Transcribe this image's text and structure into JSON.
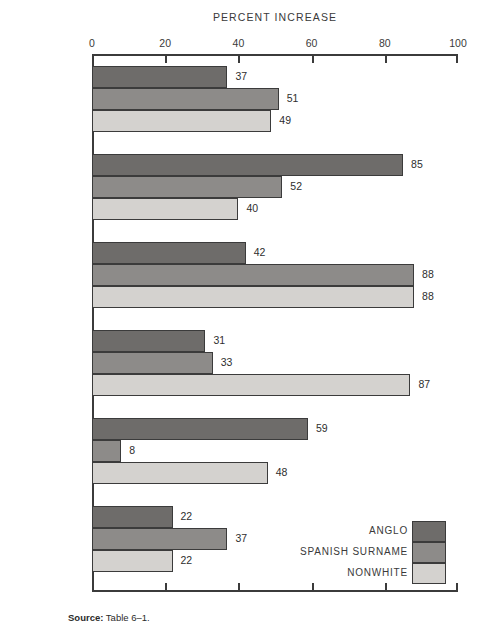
{
  "chart_data": {
    "type": "bar",
    "orientation": "horizontal",
    "title": "PERCENT INCREASE",
    "xlabel": "",
    "ylabel": "",
    "xlim": [
      0,
      100
    ],
    "xticks": [
      0,
      20,
      40,
      60,
      80,
      100
    ],
    "xtick_labels": [
      "0",
      "20",
      "40",
      "60",
      "80",
      "100"
    ],
    "grid": false,
    "legend_position": "bottom-right",
    "categories": [
      "SOUTHWEST",
      "ARIZONA",
      "CALIFORNIA",
      "COLORADO",
      "NEW MEXICO",
      "TEXAS"
    ],
    "series": [
      {
        "name": "ANGLO",
        "color": "#6e6c6a",
        "values": [
          37,
          85,
          42,
          31,
          59,
          22
        ]
      },
      {
        "name": "SPANISH SURNAME",
        "color": "#8d8b89",
        "values": [
          51,
          52,
          88,
          33,
          8,
          37
        ]
      },
      {
        "name": "NONWHITE",
        "color": "#d4d2cf",
        "values": [
          49,
          40,
          88,
          87,
          48,
          22
        ]
      }
    ],
    "source_prefix": "Source:",
    "source_text": " Table 6–1."
  },
  "colors": {
    "anglo": "#6e6c6a",
    "spanish_surname": "#8d8b89",
    "nonwhite": "#d4d2cf",
    "axis": "#3b3b3b",
    "text": "#3a3a3a",
    "background": "#ffffff"
  }
}
